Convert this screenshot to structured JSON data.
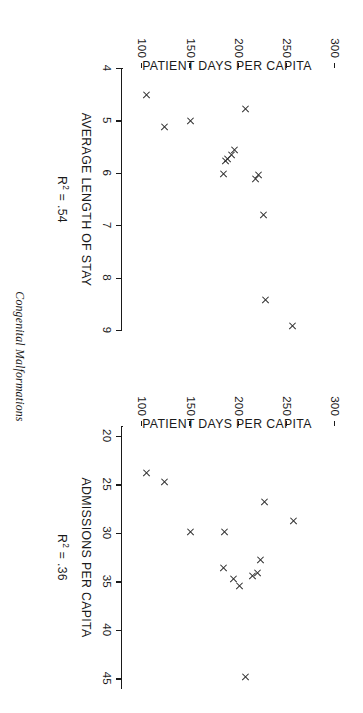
{
  "caption": "Congenital Malformations",
  "chart_data": [
    {
      "type": "scatter",
      "panel": "left",
      "title": "",
      "xlabel": "AVERAGE LENGTH OF STAY",
      "ylabel": "PATIENT DAYS PER CAPITA",
      "annotation": "R2 = .54",
      "r_squared": ".54",
      "r_squared_prefix": "R",
      "r_squared_exponent": "2",
      "r_squared_equals": " = .54",
      "xlim": [
        4,
        9
      ],
      "ylim": [
        80,
        310
      ],
      "xticks": [
        4,
        5,
        6,
        7,
        8,
        9
      ],
      "xticklabels": [
        "4",
        "5",
        "6",
        "7",
        "8",
        "9"
      ],
      "yticks": [
        100,
        150,
        200,
        250,
        300
      ],
      "yticklabels": [
        "100",
        "150",
        "200",
        "250",
        "300"
      ],
      "grid": false,
      "legend": null,
      "marker": "x",
      "points": [
        {
          "x": 4.52,
          "y": 104
        },
        {
          "x": 4.78,
          "y": 207
        },
        {
          "x": 5.02,
          "y": 150
        },
        {
          "x": 5.13,
          "y": 123
        },
        {
          "x": 5.57,
          "y": 196
        },
        {
          "x": 5.66,
          "y": 192
        },
        {
          "x": 5.73,
          "y": 188
        },
        {
          "x": 5.78,
          "y": 186
        },
        {
          "x": 6.03,
          "y": 184
        },
        {
          "x": 6.05,
          "y": 220
        },
        {
          "x": 6.12,
          "y": 217
        },
        {
          "x": 6.8,
          "y": 226
        },
        {
          "x": 8.42,
          "y": 228
        },
        {
          "x": 8.92,
          "y": 256
        }
      ]
    },
    {
      "type": "scatter",
      "panel": "right",
      "title": "",
      "xlabel": "ADMISSIONS PER CAPITA",
      "ylabel": "PATIENT DAYS PER CAPITA",
      "annotation": "R2 = .36",
      "r_squared": ".36",
      "r_squared_prefix": "R",
      "r_squared_exponent": "2",
      "r_squared_equals": " = .36",
      "xlim": [
        19,
        46
      ],
      "ylim": [
        80,
        310
      ],
      "xticks": [
        20,
        25,
        30,
        35,
        40,
        45
      ],
      "xticklabels": [
        "20",
        "25",
        "30",
        "35",
        "40",
        "45"
      ],
      "yticks": [
        100,
        150,
        200,
        250,
        300
      ],
      "yticklabels": [
        "100",
        "150",
        "200",
        "250",
        "300"
      ],
      "grid": false,
      "legend": null,
      "marker": "x",
      "points": [
        {
          "x": 23.8,
          "y": 104
        },
        {
          "x": 24.8,
          "y": 123
        },
        {
          "x": 26.8,
          "y": 227
        },
        {
          "x": 28.8,
          "y": 257
        },
        {
          "x": 29.9,
          "y": 150
        },
        {
          "x": 29.9,
          "y": 185
        },
        {
          "x": 32.8,
          "y": 222
        },
        {
          "x": 33.6,
          "y": 184
        },
        {
          "x": 34.5,
          "y": 214
        },
        {
          "x": 34.2,
          "y": 219
        },
        {
          "x": 34.8,
          "y": 194
        },
        {
          "x": 35.5,
          "y": 201
        },
        {
          "x": 44.9,
          "y": 207
        }
      ]
    }
  ]
}
